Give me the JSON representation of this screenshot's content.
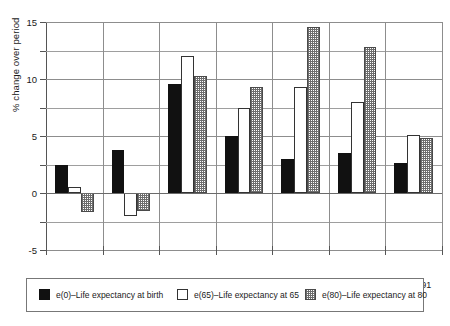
{
  "chart_data": {
    "type": "bar",
    "title": "",
    "xlabel": "",
    "ylabel": "% change over period",
    "ylim": [
      -5,
      15
    ],
    "ytick_labels": [
      "15",
      "10",
      "5",
      "0",
      "-5"
    ],
    "ytick_values": [
      15,
      10,
      5,
      0,
      -5
    ],
    "minor_gridline_values": [
      12.5,
      7.5,
      2.5,
      -2.5
    ],
    "grid": true,
    "legend_position": "below-plot",
    "categories": [
      "1921–31",
      "1931–41",
      "1941–51",
      "1951–61",
      "1961–71",
      "1971–81",
      "1981–91"
    ],
    "series": [
      {
        "name": "e(0)–Life expectancy at  birth",
        "key": "e0",
        "fill": "solid-black",
        "values": [
          2.5,
          3.8,
          9.6,
          5.0,
          3.0,
          3.5,
          2.6
        ]
      },
      {
        "name": "e(65)–Life expectancy at  65",
        "key": "e65",
        "fill": "white-outline",
        "values": [
          0.5,
          -2.0,
          12.0,
          7.5,
          9.3,
          8.0,
          5.1
        ]
      },
      {
        "name": "e(80)–Life expectancy at  80",
        "key": "e80",
        "fill": "checkered",
        "values": [
          -1.7,
          -1.6,
          10.3,
          9.3,
          14.6,
          12.8,
          4.8
        ]
      }
    ]
  },
  "legend": {
    "items": [
      {
        "label": "e(0)–Life expectancy at  birth"
      },
      {
        "label": "e(65)–Life expectancy at  65"
      },
      {
        "label": "e(80)–Life expectancy at  80"
      }
    ]
  },
  "colors": {
    "series_0": "#111111",
    "series_1": "#ffffff",
    "series_2": "#6d6d6d",
    "axis": "#555555",
    "grid": "#8d8d8d"
  }
}
